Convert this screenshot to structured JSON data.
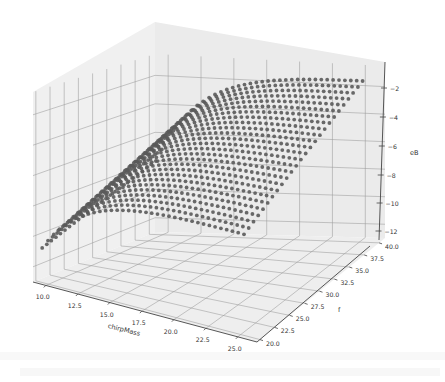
{
  "chart_data": {
    "type": "scatter",
    "projection": "3d",
    "title": "",
    "xlabel": "chirpMass",
    "ylabel": "f",
    "zlabel": "eB",
    "x_ticks": [
      "10.0",
      "12.5",
      "15.0",
      "17.5",
      "20.0",
      "22.5",
      "25.0"
    ],
    "y_ticks": [
      "20.0",
      "22.5",
      "25.0",
      "27.5",
      "30.0",
      "32.5",
      "35.0",
      "37.5",
      "40.0"
    ],
    "z_ticks": [
      "−2",
      "−4",
      "−6",
      "−8",
      "−10",
      "−12"
    ],
    "xlim": [
      9,
      26.5
    ],
    "ylim": [
      19.5,
      41
    ],
    "zlim": [
      -13,
      -0.5
    ],
    "grid": true,
    "legend": null,
    "marker_color": "#5a5a5a",
    "series": [
      {
        "name": "eB",
        "points_sample": [
          {
            "chirpMass": 9.5,
            "f": 20.0,
            "eB": -12.0
          },
          {
            "chirpMass": 9.5,
            "f": 40.0,
            "eB": -9.5
          },
          {
            "chirpMass": 12.5,
            "f": 20.0,
            "eB": -9.0
          },
          {
            "chirpMass": 15.0,
            "f": 20.0,
            "eB": -7.6
          },
          {
            "chirpMass": 20.0,
            "f": 20.0,
            "eB": -6.8
          },
          {
            "chirpMass": 25.0,
            "f": 20.0,
            "eB": -6.5
          },
          {
            "chirpMass": 15.0,
            "f": 30.0,
            "eB": -4.5
          },
          {
            "chirpMass": 20.0,
            "f": 30.0,
            "eB": -3.2
          },
          {
            "chirpMass": 25.0,
            "f": 30.0,
            "eB": -2.8
          },
          {
            "chirpMass": 15.0,
            "f": 40.0,
            "eB": -3.0
          },
          {
            "chirpMass": 20.0,
            "f": 40.0,
            "eB": -1.8
          },
          {
            "chirpMass": 25.0,
            "f": 40.0,
            "eB": -1.5
          }
        ]
      }
    ]
  },
  "axes": {
    "x_label": "chirpMass",
    "y_label": "f",
    "z_label": "eB"
  },
  "background_text": {
    "note": "faint illegible scanned text bleeding through below the figure"
  }
}
